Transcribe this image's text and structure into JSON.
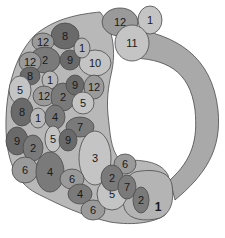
{
  "diagram": {
    "colors": {
      "band": "#a9a9a9",
      "base": "#b8b8b8",
      "light": "#c4c4c4",
      "mid": "#9a9a9a",
      "dark": "#7a7a7a",
      "darker": "#6a6a6a",
      "outline": "#4a4a4a",
      "text": "#1a1a1a"
    },
    "big_label": "1",
    "regions": [
      {
        "id": "r1",
        "label": "12",
        "cx": 120,
        "cy": 22,
        "rx": 18,
        "ry": 14,
        "tone": "mid"
      },
      {
        "id": "r2",
        "label": "1",
        "cx": 150,
        "cy": 20,
        "rx": 12,
        "ry": 14,
        "tone": "light"
      },
      {
        "id": "r3",
        "label": "11",
        "cx": 132,
        "cy": 43,
        "rx": 17,
        "ry": 18,
        "tone": "light"
      },
      {
        "id": "r4",
        "label": "10",
        "cx": 95,
        "cy": 63,
        "rx": 16,
        "ry": 13,
        "tone": "light"
      },
      {
        "id": "r5",
        "label": "8",
        "cx": 65,
        "cy": 36,
        "rx": 14,
        "ry": 13,
        "tone": "darker"
      },
      {
        "id": "r6",
        "label": "12",
        "cx": 43,
        "cy": 42,
        "rx": 11,
        "ry": 9,
        "tone": "mid"
      },
      {
        "id": "r7",
        "label": "2",
        "cx": 45,
        "cy": 60,
        "rx": 15,
        "ry": 13,
        "tone": "dark"
      },
      {
        "id": "r8",
        "label": "9",
        "cx": 70,
        "cy": 60,
        "rx": 10,
        "ry": 10,
        "tone": "darker"
      },
      {
        "id": "r9",
        "label": "1",
        "cx": 82,
        "cy": 48,
        "rx": 8,
        "ry": 10,
        "tone": "base"
      },
      {
        "id": "r10",
        "label": "12",
        "cx": 30,
        "cy": 62,
        "rx": 11,
        "ry": 10,
        "tone": "mid"
      },
      {
        "id": "r11",
        "label": "8",
        "cx": 30,
        "cy": 76,
        "rx": 10,
        "ry": 9,
        "tone": "darker"
      },
      {
        "id": "r12",
        "label": "1",
        "cx": 50,
        "cy": 80,
        "rx": 8,
        "ry": 9,
        "tone": "base"
      },
      {
        "id": "r13",
        "label": "5",
        "cx": 20,
        "cy": 90,
        "rx": 11,
        "ry": 14,
        "tone": "light"
      },
      {
        "id": "r14",
        "label": "12",
        "cx": 44,
        "cy": 96,
        "rx": 11,
        "ry": 10,
        "tone": "mid"
      },
      {
        "id": "r15",
        "label": "2",
        "cx": 63,
        "cy": 97,
        "rx": 12,
        "ry": 14,
        "tone": "dark"
      },
      {
        "id": "r16",
        "label": "9",
        "cx": 75,
        "cy": 85,
        "rx": 9,
        "ry": 10,
        "tone": "darker"
      },
      {
        "id": "r17",
        "label": "12",
        "cx": 94,
        "cy": 87,
        "rx": 10,
        "ry": 12,
        "tone": "mid"
      },
      {
        "id": "r18",
        "label": "5",
        "cx": 83,
        "cy": 103,
        "rx": 11,
        "ry": 11,
        "tone": "light"
      },
      {
        "id": "r19",
        "label": "8",
        "cx": 22,
        "cy": 112,
        "rx": 11,
        "ry": 14,
        "tone": "darker"
      },
      {
        "id": "r20",
        "label": "1",
        "cx": 38,
        "cy": 118,
        "rx": 8,
        "ry": 10,
        "tone": "base"
      },
      {
        "id": "r21",
        "label": "4",
        "cx": 55,
        "cy": 117,
        "rx": 10,
        "ry": 12,
        "tone": "dark"
      },
      {
        "id": "r22",
        "label": "7",
        "cx": 80,
        "cy": 127,
        "rx": 14,
        "ry": 10,
        "tone": "dark"
      },
      {
        "id": "r23",
        "label": "9",
        "cx": 17,
        "cy": 141,
        "rx": 11,
        "ry": 14,
        "tone": "darker"
      },
      {
        "id": "r24",
        "label": "2",
        "cx": 33,
        "cy": 148,
        "rx": 10,
        "ry": 13,
        "tone": "dark"
      },
      {
        "id": "r25",
        "label": "5",
        "cx": 53,
        "cy": 139,
        "rx": 8,
        "ry": 13,
        "tone": "light"
      },
      {
        "id": "r26",
        "label": "9",
        "cx": 68,
        "cy": 140,
        "rx": 9,
        "ry": 11,
        "tone": "darker"
      },
      {
        "id": "r27",
        "label": "6",
        "cx": 25,
        "cy": 170,
        "rx": 13,
        "ry": 13,
        "tone": "mid"
      },
      {
        "id": "r28",
        "label": "4",
        "cx": 50,
        "cy": 172,
        "rx": 14,
        "ry": 20,
        "tone": "dark"
      },
      {
        "id": "r29",
        "label": "3",
        "cx": 95,
        "cy": 158,
        "rx": 16,
        "ry": 27,
        "tone": "light"
      },
      {
        "id": "r30",
        "label": "6",
        "cx": 72,
        "cy": 179,
        "rx": 12,
        "ry": 10,
        "tone": "mid"
      },
      {
        "id": "r31",
        "label": "4",
        "cx": 80,
        "cy": 194,
        "rx": 12,
        "ry": 10,
        "tone": "dark"
      },
      {
        "id": "r32",
        "label": "6",
        "cx": 93,
        "cy": 210,
        "rx": 12,
        "ry": 10,
        "tone": "mid"
      },
      {
        "id": "r33",
        "label": "5",
        "cx": 112,
        "cy": 194,
        "rx": 15,
        "ry": 16,
        "tone": "light"
      },
      {
        "id": "r34",
        "label": "6",
        "cx": 125,
        "cy": 164,
        "rx": 11,
        "ry": 10,
        "tone": "mid"
      },
      {
        "id": "r35",
        "label": "2",
        "cx": 112,
        "cy": 178,
        "rx": 11,
        "ry": 13,
        "tone": "dark"
      },
      {
        "id": "r36",
        "label": "7",
        "cx": 127,
        "cy": 187,
        "rx": 9,
        "ry": 12,
        "tone": "dark"
      },
      {
        "id": "r37",
        "label": "2",
        "cx": 141,
        "cy": 200,
        "rx": 8,
        "ry": 13,
        "tone": "dark"
      }
    ]
  }
}
